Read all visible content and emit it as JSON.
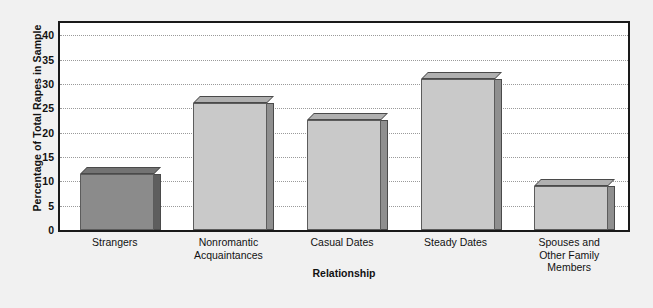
{
  "chart_data": {
    "type": "bar",
    "title": "",
    "xlabel": "Relationship",
    "ylabel": "Percentage of Total Rapes in Sample",
    "categories": [
      "Strangers",
      "Nonromantic Acquaintances",
      "Casual Dates",
      "Steady Dates",
      "Spouses and Other Family Members"
    ],
    "category_lines": [
      [
        "Strangers"
      ],
      [
        "Nonromantic",
        "Acquaintances"
      ],
      [
        "Casual Dates"
      ],
      [
        "Steady Dates"
      ],
      [
        "Spouses and",
        "Other Family",
        "Members"
      ]
    ],
    "values": [
      11.5,
      26,
      22.5,
      31,
      9
    ],
    "ylim": [
      0,
      42.5
    ],
    "yticks": [
      0,
      5,
      10,
      15,
      20,
      25,
      30,
      35,
      40
    ],
    "ytick_labels": [
      "0",
      "5",
      "10",
      "15",
      "20",
      "25",
      "30",
      "35",
      "40"
    ],
    "grid": true,
    "grid_style": "dotted",
    "legend": "none",
    "bar_colors": [
      "#8b8b8b",
      "#c9c9c9",
      "#c9c9c9",
      "#c9c9c9",
      "#c9c9c9"
    ],
    "style": "3d-block",
    "background": "#f1f1f1",
    "plot_background": "#ffffff",
    "frame_color": "#1a1a1a"
  }
}
